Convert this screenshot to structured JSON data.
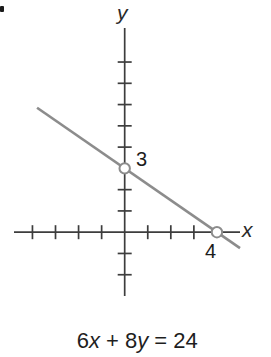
{
  "chart_data": {
    "type": "line",
    "title": "",
    "xlabel": "x",
    "ylabel": "y",
    "xlim": [
      -4.8,
      5.0
    ],
    "ylim": [
      -3.0,
      9.6
    ],
    "grid": false,
    "legend": null,
    "x_ticks": [
      -4,
      -3,
      -2,
      -1,
      1,
      2,
      3
    ],
    "y_ticks": [
      -2,
      -1,
      1,
      2,
      4,
      5,
      6,
      7,
      8
    ],
    "line": {
      "equation": "6x + 8y = 24",
      "a": 6,
      "b": 8,
      "c": 24,
      "slope": -0.75,
      "x_start": -3.8,
      "x_end": 5.0
    },
    "points": [
      {
        "x": 0,
        "y": 3,
        "label": "3",
        "style": "open-circle"
      },
      {
        "x": 4,
        "y": 0,
        "label": "4",
        "style": "open-circle"
      }
    ],
    "colors": {
      "axis": "#3d3d3d",
      "line": "#8c8c8c",
      "point_fill": "#ffffff",
      "text": "#1e1e1e"
    }
  },
  "equation_parts": {
    "coef1": "6",
    "var1": "x",
    "mid": " + 8",
    "var2": "y",
    "rhs": " = 24"
  }
}
